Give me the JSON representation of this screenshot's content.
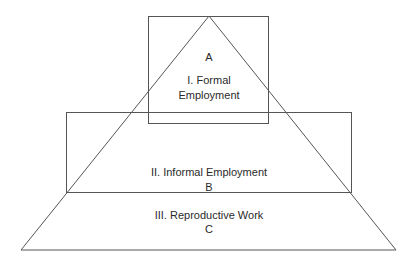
{
  "diagram": {
    "type": "pyramid-with-overlapping-boxes",
    "colors": {
      "stroke": "#555555",
      "background": "#ffffff",
      "text": "#2a2a2a"
    },
    "boxes": [
      {
        "id": "A",
        "letter": "A",
        "line1": "I. Formal",
        "line2": "Employment"
      },
      {
        "id": "B",
        "label": "II. Informal Employment",
        "letter": "B"
      }
    ],
    "base": {
      "id": "C",
      "label": "III. Reproductive Work",
      "letter": "C"
    }
  }
}
